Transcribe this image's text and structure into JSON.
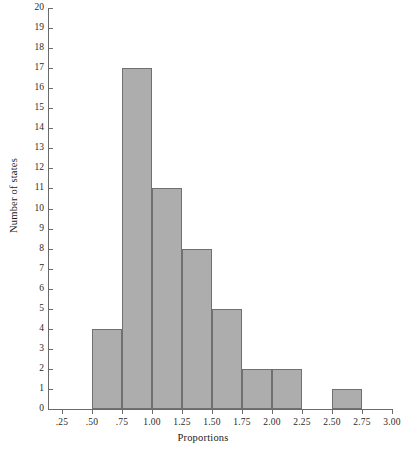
{
  "chart_data": {
    "type": "bar",
    "title": "",
    "subtitle": "",
    "xlabel": "Proportions",
    "ylabel": "Number of states",
    "grid": false,
    "legend": null,
    "xlim": [
      0.0,
      3.0
    ],
    "ylim": [
      0,
      20
    ],
    "bin_width": 0.25,
    "x_tick_labels": [
      ".25",
      ".50",
      ".75",
      "1.00",
      "1.25",
      "1.50",
      "1.75",
      "2.00",
      "2.25",
      "2.50",
      "2.75",
      "3.00"
    ],
    "x_tick_values": [
      0.25,
      0.5,
      0.75,
      1.0,
      1.25,
      1.5,
      1.75,
      2.0,
      2.25,
      2.5,
      2.75,
      3.0
    ],
    "y_tick_labels": [
      "0",
      "1",
      "2",
      "3",
      "4",
      "5",
      "6",
      "7",
      "8",
      "9",
      "10",
      "11",
      "12",
      "13",
      "14",
      "15",
      "16",
      "17",
      "18",
      "19",
      "20"
    ],
    "y_tick_values": [
      0,
      1,
      2,
      3,
      4,
      5,
      6,
      7,
      8,
      9,
      10,
      11,
      12,
      13,
      14,
      15,
      16,
      17,
      18,
      19,
      20
    ],
    "categories": [
      "0.50-0.75",
      "0.75-1.00",
      "1.00-1.25",
      "1.25-1.50",
      "1.50-1.75",
      "1.75-2.00",
      "2.00-2.25",
      "2.25-2.50",
      "2.50-2.75"
    ],
    "values": [
      4,
      17,
      11,
      8,
      5,
      2,
      2,
      0,
      1
    ],
    "bins": [
      {
        "start": 0.5,
        "end": 0.75,
        "count": 4
      },
      {
        "start": 0.75,
        "end": 1.0,
        "count": 17
      },
      {
        "start": 1.0,
        "end": 1.25,
        "count": 11
      },
      {
        "start": 1.25,
        "end": 1.5,
        "count": 8
      },
      {
        "start": 1.5,
        "end": 1.75,
        "count": 5
      },
      {
        "start": 1.75,
        "end": 2.0,
        "count": 2
      },
      {
        "start": 2.0,
        "end": 2.25,
        "count": 2
      },
      {
        "start": 2.25,
        "end": 2.5,
        "count": 0
      },
      {
        "start": 2.5,
        "end": 2.75,
        "count": 1
      }
    ],
    "colors": {
      "bar_fill": "#adadad",
      "bar_border": "#707070",
      "axis": "#6b6b6b",
      "text": "#1a1a1a",
      "background": "#ffffff"
    }
  }
}
